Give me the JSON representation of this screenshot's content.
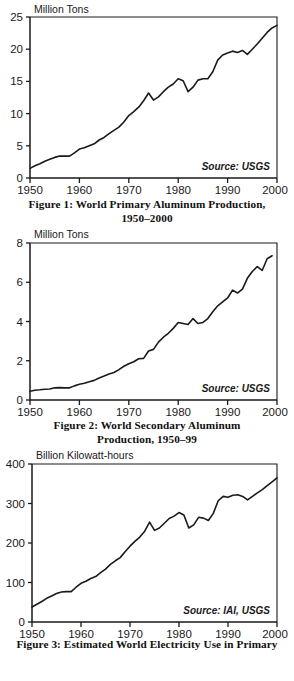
{
  "document": {
    "title": "World Aluminum Production and Electricity Use Figures"
  },
  "figures": [
    {
      "id": "figure-1",
      "caption_line1": "Figure 1:  World Primary Aluminum Production,",
      "caption_line2": "1950–2000",
      "unit_label": "Million Tons",
      "source_label": "Source: USGS"
    },
    {
      "id": "figure-2",
      "caption_line1": "Figure 2:  World Secondary Aluminum",
      "caption_line2": "Production, 1950–99",
      "unit_label": "Million Tons",
      "source_label": "Source: USGS"
    },
    {
      "id": "figure-3",
      "caption_line1": "Figure 3:  Estimated World Electricity Use in Primary",
      "caption_line2": "",
      "unit_label": "Billion Kilowatt-hours",
      "source_label": "Source: IAI, USGS"
    }
  ],
  "chart_data": [
    {
      "type": "line",
      "title": "World Primary Aluminum Production, 1950–2000",
      "xlabel": "",
      "ylabel": "Million Tons",
      "source": "Source: USGS",
      "xlim": [
        1950,
        2000
      ],
      "ylim": [
        0,
        25
      ],
      "xticks": [
        1950,
        1960,
        1970,
        1980,
        1990,
        2000
      ],
      "yticks": [
        0,
        5,
        10,
        15,
        20,
        25
      ],
      "grid": false,
      "legend": "none",
      "x": [
        1950,
        1951,
        1952,
        1953,
        1954,
        1955,
        1956,
        1957,
        1958,
        1959,
        1960,
        1961,
        1962,
        1963,
        1964,
        1965,
        1966,
        1967,
        1968,
        1969,
        1970,
        1971,
        1972,
        1973,
        1974,
        1975,
        1976,
        1977,
        1978,
        1979,
        1980,
        1981,
        1982,
        1983,
        1984,
        1985,
        1986,
        1987,
        1988,
        1989,
        1990,
        1991,
        1992,
        1993,
        1994,
        1995,
        1996,
        1997,
        1998,
        1999,
        2000
      ],
      "values": [
        1.5,
        1.9,
        2.2,
        2.6,
        2.9,
        3.2,
        3.4,
        3.4,
        3.4,
        3.9,
        4.5,
        4.7,
        5.0,
        5.3,
        5.9,
        6.3,
        6.9,
        7.4,
        7.9,
        8.7,
        9.7,
        10.3,
        11.0,
        12.0,
        13.2,
        12.1,
        12.6,
        13.4,
        14.1,
        14.6,
        15.4,
        15.1,
        13.4,
        14.1,
        15.2,
        15.4,
        15.4,
        16.5,
        18.3,
        19.1,
        19.4,
        19.7,
        19.5,
        19.8,
        19.2,
        20.0,
        20.8,
        21.7,
        22.6,
        23.3,
        23.7
      ]
    },
    {
      "type": "line",
      "title": "World Secondary Aluminum Production, 1950–99",
      "xlabel": "",
      "ylabel": "Million Tons",
      "source": "Source: USGS",
      "xlim": [
        1950,
        2000
      ],
      "ylim": [
        0,
        8
      ],
      "xticks": [
        1950,
        1960,
        1970,
        1980,
        1990,
        2000
      ],
      "yticks": [
        0,
        2,
        4,
        6,
        8
      ],
      "grid": false,
      "legend": "none",
      "x": [
        1950,
        1951,
        1952,
        1953,
        1954,
        1955,
        1956,
        1957,
        1958,
        1959,
        1960,
        1961,
        1962,
        1963,
        1964,
        1965,
        1966,
        1967,
        1968,
        1969,
        1970,
        1971,
        1972,
        1973,
        1974,
        1975,
        1976,
        1977,
        1978,
        1979,
        1980,
        1981,
        1982,
        1983,
        1984,
        1985,
        1986,
        1987,
        1988,
        1989,
        1990,
        1991,
        1992,
        1993,
        1994,
        1995,
        1996,
        1997,
        1998,
        1999
      ],
      "values": [
        0.45,
        0.5,
        0.52,
        0.55,
        0.56,
        0.62,
        0.63,
        0.62,
        0.62,
        0.72,
        0.8,
        0.85,
        0.93,
        1.0,
        1.12,
        1.22,
        1.33,
        1.4,
        1.55,
        1.72,
        1.85,
        1.95,
        2.1,
        2.12,
        2.5,
        2.58,
        2.95,
        3.2,
        3.4,
        3.65,
        3.95,
        3.9,
        3.85,
        4.15,
        3.9,
        3.95,
        4.15,
        4.5,
        4.8,
        5.0,
        5.2,
        5.6,
        5.45,
        5.65,
        6.2,
        6.55,
        6.8,
        6.6,
        7.2,
        7.35,
        7.85
      ]
    },
    {
      "type": "line",
      "title": "Estimated World Electricity Use in Primary Aluminum Production",
      "xlabel": "",
      "ylabel": "Billion Kilowatt-hours",
      "source": "Source: IAI, USGS",
      "xlim": [
        1950,
        2000
      ],
      "ylim": [
        0,
        400
      ],
      "xticks": [
        1950,
        1960,
        1970,
        1980,
        1990,
        2000
      ],
      "yticks": [
        0,
        100,
        200,
        300,
        400
      ],
      "grid": false,
      "legend": "none",
      "x": [
        1950,
        1951,
        1952,
        1953,
        1954,
        1955,
        1956,
        1957,
        1958,
        1959,
        1960,
        1961,
        1962,
        1963,
        1964,
        1965,
        1966,
        1967,
        1968,
        1969,
        1970,
        1971,
        1972,
        1973,
        1974,
        1975,
        1976,
        1977,
        1978,
        1979,
        1980,
        1981,
        1982,
        1983,
        1984,
        1985,
        1986,
        1987,
        1988,
        1989,
        1990,
        1991,
        1992,
        1993,
        1994,
        1995,
        1996,
        1997,
        1998,
        1999,
        2000
      ],
      "values": [
        38,
        45,
        52,
        60,
        66,
        72,
        76,
        77,
        77,
        88,
        98,
        103,
        110,
        115,
        125,
        134,
        146,
        155,
        163,
        178,
        192,
        204,
        215,
        230,
        253,
        232,
        238,
        250,
        262,
        268,
        277,
        271,
        238,
        246,
        265,
        263,
        257,
        275,
        307,
        318,
        316,
        321,
        322,
        318,
        309,
        318,
        327,
        335,
        345,
        355,
        365
      ]
    }
  ]
}
